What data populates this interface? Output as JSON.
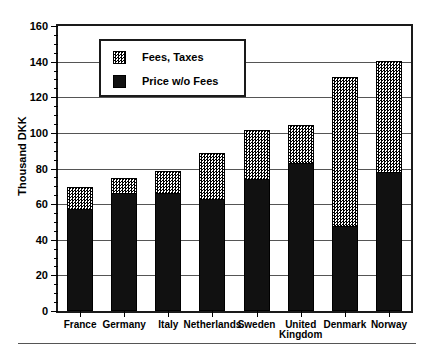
{
  "chart_data": {
    "type": "bar",
    "subtype": "stacked-vertical",
    "title": "",
    "xlabel": "",
    "ylabel": "Thousand DKK",
    "ylim": [
      0,
      160
    ],
    "ytick_step": 20,
    "yticks": [
      0,
      20,
      40,
      60,
      80,
      100,
      120,
      140,
      160
    ],
    "ytick_labels": [
      "0",
      "20",
      "40",
      "60",
      "80",
      "100",
      "120",
      "140",
      "160"
    ],
    "minor_ticks_per_interval": 4,
    "grid": "horizontal",
    "legend_position": "upper-left-inside",
    "categories": [
      "France",
      "Germany",
      "Italy",
      "Netherlands",
      "Sweden",
      "United\nKingdom",
      "Denmark",
      "Norway"
    ],
    "series": [
      {
        "name": "Price w/o Fees",
        "fill": "solid-black",
        "color": "#111111",
        "values": [
          57,
          66,
          66,
          63,
          74,
          83,
          48,
          78
        ]
      },
      {
        "name": "Fees, Taxes",
        "fill": "checker-gray",
        "color": "#8a8a8a",
        "values": [
          13,
          9,
          13,
          26,
          28,
          22,
          84,
          63
        ]
      }
    ],
    "totals": [
      70,
      75,
      79,
      89,
      102,
      105,
      132,
      141
    ]
  },
  "axes": {
    "y_title": "Thousand DKK"
  },
  "legend": {
    "entries": [
      {
        "label": "Fees, Taxes",
        "swatch": "checker-gray-swatch"
      },
      {
        "label": "Price w/o Fees",
        "swatch": "solid-black-swatch"
      }
    ]
  },
  "colors": {
    "frame": "#1a1a1a",
    "grid": "#555555",
    "price_fill": "#111111",
    "fees_fill": "#8a8a8a",
    "background": "#ffffff"
  }
}
